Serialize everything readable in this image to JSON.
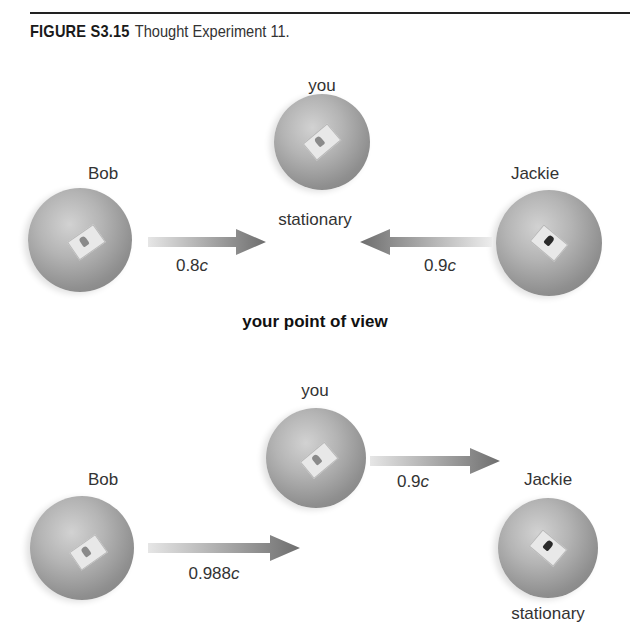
{
  "caption": {
    "figure_number": "FIGURE S3.15",
    "title": "Thought Experiment 11."
  },
  "panel_top": {
    "you": {
      "label": "you",
      "status": "stationary"
    },
    "bob": {
      "label": "Bob",
      "speed_value": "0.8",
      "speed_unit": "c",
      "direction": "right"
    },
    "jackie": {
      "label": "Jackie",
      "speed_value": "0.9",
      "speed_unit": "c",
      "direction": "left"
    }
  },
  "section_heading": "your point of view",
  "panel_bottom": {
    "you": {
      "label": "you",
      "speed_value": "0.9",
      "speed_unit": "c",
      "direction": "right"
    },
    "bob": {
      "label": "Bob",
      "speed_value": "0.988",
      "speed_unit": "c",
      "direction": "right"
    },
    "jackie": {
      "label": "Jackie",
      "status": "stationary"
    }
  },
  "colors": {
    "sphere_light": "#d2d2d2",
    "sphere_dark": "#7a7a7a",
    "arrow_head": "#6e6e6e",
    "arrow_tail": "#e0e0e0",
    "text": "#333333",
    "rule": "#222222"
  }
}
